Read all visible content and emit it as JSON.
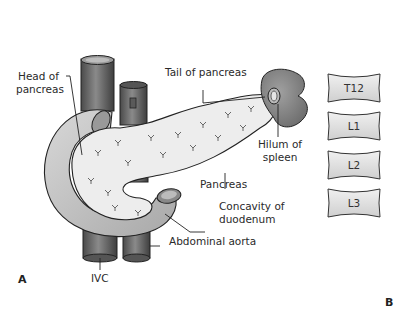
{
  "figure": {
    "panel_a_label": "A",
    "panel_b_label": "B",
    "labels": {
      "head_of_pancreas_line1": "Head of",
      "head_of_pancreas_line2": "pancreas",
      "tail_of_pancreas": "Tail of pancreas",
      "hilum_line1": "Hilum of",
      "hilum_line2": "spleen",
      "pancreas": "Pancreas",
      "concavity_line1": "Concavity of",
      "concavity_line2": "duodenum",
      "abdominal_aorta": "Abdominal aorta",
      "ivc": "IVC"
    },
    "vertebrae": [
      {
        "label": "T12"
      },
      {
        "label": "L1"
      },
      {
        "label": "L2"
      },
      {
        "label": "L3"
      }
    ],
    "colors": {
      "vessel": "#6a6a6a",
      "spleen": "#8c8c8c",
      "pancreas": "#ececec",
      "duodenum": "#c8c8c8",
      "vertebra": "#e2e2e2",
      "outline": "#2a2a2a"
    }
  }
}
